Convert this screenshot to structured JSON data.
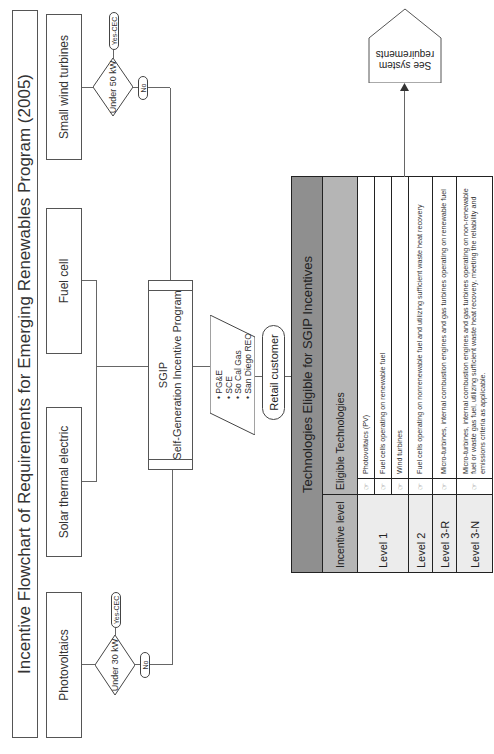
{
  "title": "Incentive Flowchart of Requirements for Emerging Renewables Program (2005)",
  "technologies": {
    "photovoltaics": "Photovoltaics",
    "solar_thermal": "Solar thermal electric",
    "fuel_cell": "Fuel cell",
    "small_wind": "Small wind turbines"
  },
  "decisions": {
    "pv": {
      "question": "Under 30 kW",
      "yes": "Yes-CEC",
      "no": "No"
    },
    "wind": {
      "question": "Under 50 kW",
      "yes": "Yes-CEC",
      "no": "No"
    }
  },
  "sgip": {
    "acronym": "SGIP",
    "name": "Self-Generation Incentive Program"
  },
  "utilities": {
    "items": [
      "PG&E",
      "SCE",
      "So Cal Gas",
      "San Diego REO"
    ]
  },
  "retail_customer": "Retail customer",
  "table": {
    "title": "Technologies Eligible for SGIP Incentives",
    "headers": {
      "level": "Incentive level",
      "tech": "Eligible Technologies"
    },
    "icon": "hand-pointer-icon",
    "rows": [
      {
        "level": "Level 1",
        "tech": "Photovoltaics (PV)"
      },
      {
        "level": "",
        "tech": "Fuel cells operating on renewable fuel"
      },
      {
        "level": "",
        "tech": "Wind turbines"
      },
      {
        "level": "Level 2",
        "tech": "Fuel cells operating on nonrenewable fuel and utilizing sufficient waste heat recovery"
      },
      {
        "level": "Level 3-R",
        "tech": "Micro-turbines, internal combustion engines and gas turbines operating on renewable fuel"
      },
      {
        "level": "Level 3-N",
        "tech": "Micro-turbines, internal combustion engines and gas turbines operating on non-renewable fuel or waste gas fuel, utilizing sufficient waste heat recovery, meeting the reliability and emissions criteria as applicable."
      }
    ]
  },
  "see_requirements": "See system requirements"
}
